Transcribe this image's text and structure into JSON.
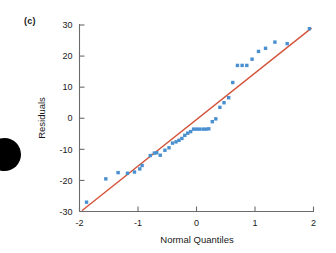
{
  "figure": {
    "panel_label": "(c)",
    "marker_color": "#4a8fd0",
    "line_color": "#d4543a",
    "axis_color": "#6b6b6b",
    "text_color": "#1a1a1a",
    "background": "#ffffff"
  },
  "chart_data": {
    "type": "scatter",
    "title": "",
    "subtitle": "",
    "xlabel": "Normal Quantiles",
    "ylabel": "Residuals",
    "xlim": [
      -2,
      2
    ],
    "ylim": [
      -30,
      30
    ],
    "xticks": [
      -2,
      -1,
      0,
      1,
      2
    ],
    "xticklabels": [
      "-2",
      "-1",
      "0",
      "1",
      "2"
    ],
    "yticks": [
      -30,
      -20,
      -10,
      0,
      10,
      20,
      30
    ],
    "yticklabels": [
      "-30",
      "-20",
      "-10",
      "0",
      "10",
      "20",
      "30"
    ],
    "grid": false,
    "legend": null,
    "annotations": [
      {
        "text": "(c)",
        "position": "top-left-outside"
      }
    ],
    "series": [
      {
        "name": "Residual quantiles",
        "type": "scatter",
        "marker": "square-dot",
        "color": "#4a8fd0",
        "x": [
          -1.88,
          -1.55,
          -1.34,
          -1.18,
          -1.06,
          -0.97,
          -0.93,
          -0.79,
          -0.72,
          -0.68,
          -0.62,
          -0.54,
          -0.47,
          -0.41,
          -0.35,
          -0.3,
          -0.25,
          -0.2,
          -0.15,
          -0.1,
          -0.05,
          0.0,
          0.05,
          0.11,
          0.16,
          0.21,
          0.27,
          0.33,
          0.4,
          0.47,
          0.55,
          0.62,
          0.7,
          0.78,
          0.86,
          0.95,
          1.06,
          1.18,
          1.34,
          1.55,
          1.93
        ],
        "y": [
          -27.0,
          -19.5,
          -17.5,
          -17.7,
          -17.3,
          -16.3,
          -15.2,
          -12.0,
          -11.2,
          -11.1,
          -11.9,
          -10.3,
          -9.5,
          -8.0,
          -7.6,
          -7.1,
          -6.5,
          -5.5,
          -4.8,
          -4.3,
          -3.5,
          -3.5,
          -3.5,
          -3.5,
          -3.5,
          -3.4,
          -1.1,
          -0.2,
          3.5,
          5.0,
          6.6,
          11.5,
          17.0,
          17.0,
          17.0,
          19.0,
          21.5,
          22.5,
          24.5,
          24.0,
          28.8
        ]
      },
      {
        "name": "Reference line",
        "type": "line",
        "color": "#d4543a",
        "x": [
          -1.95,
          1.96
        ],
        "y": [
          -29.6,
          28.9
        ]
      }
    ]
  }
}
